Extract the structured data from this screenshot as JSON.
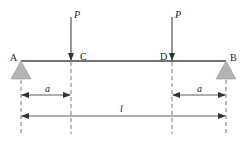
{
  "diagram": {
    "title": "",
    "type": "simply-supported-beam",
    "colors": {
      "line": "#333333",
      "support_fill": "#b3b3b3",
      "support_stroke": "#888888",
      "dash": "#555555"
    },
    "points": {
      "A": {
        "label": "A",
        "x": 21
      },
      "C": {
        "label": "C",
        "x": 71
      },
      "D": {
        "label": "D",
        "x": 172
      },
      "B": {
        "label": "B",
        "x": 226
      }
    },
    "loads": [
      {
        "label": "P",
        "at": "C"
      },
      {
        "label": "P",
        "at": "D"
      }
    ],
    "dimensions": [
      {
        "label": "a",
        "from": "A",
        "to": "C"
      },
      {
        "label": "a",
        "from": "D",
        "to": "B"
      },
      {
        "label": "l",
        "from": "A",
        "to": "B"
      }
    ]
  }
}
